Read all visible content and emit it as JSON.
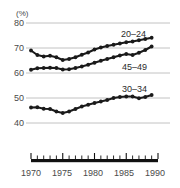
{
  "chart_data": {
    "type": "line",
    "title": "",
    "subtitle": "",
    "xlabel": "",
    "ylabel": "",
    "unit_label": "(%)",
    "xlim": [
      1969,
      1990
    ],
    "ylim": [
      36,
      82
    ],
    "yticks": [
      80,
      70,
      60,
      50,
      40
    ],
    "ytick_labels": [
      "80",
      "70",
      "60",
      "50",
      "40"
    ],
    "xticks": [
      1970,
      1975,
      1980,
      1985,
      1990
    ],
    "xtick_labels": [
      "1970",
      "1975",
      "1980",
      "1985",
      "1990"
    ],
    "minor_xtick_interval": 1,
    "grid": "horizontal",
    "legend_position": "inline-right",
    "marker": "filled-circle",
    "line_color": "#1a1a1a",
    "grid_color": "#b3b3b3",
    "axis_color": "#111111",
    "x": [
      1970,
      1971,
      1972,
      1973,
      1974,
      1975,
      1976,
      1977,
      1978,
      1979,
      1980,
      1981,
      1982,
      1983,
      1984,
      1985,
      1986,
      1987,
      1988,
      1989
    ],
    "series": [
      {
        "name": "20–24",
        "label": "20–24",
        "values": [
          69.0,
          67.2,
          66.6,
          66.9,
          66.3,
          65.2,
          65.6,
          66.3,
          67.3,
          68.2,
          69.4,
          70.2,
          70.8,
          71.3,
          71.8,
          72.3,
          72.6,
          73.1,
          73.6,
          74.1
        ]
      },
      {
        "name": "45–49",
        "label": "45–49",
        "values": [
          61.3,
          61.9,
          62.0,
          62.1,
          62.0,
          61.4,
          61.5,
          62.0,
          62.6,
          63.3,
          64.1,
          64.9,
          65.6,
          66.3,
          67.0,
          67.6,
          67.2,
          68.1,
          69.2,
          70.6
        ]
      },
      {
        "name": "30–34",
        "label": "30–34",
        "values": [
          46.2,
          46.3,
          45.7,
          45.6,
          44.6,
          44.0,
          44.6,
          45.6,
          46.6,
          47.3,
          48.0,
          48.6,
          49.2,
          50.0,
          50.4,
          50.6,
          50.6,
          49.9,
          50.4,
          51.2
        ]
      }
    ],
    "series_label_positions": [
      {
        "name": "20–24",
        "x": 121,
        "y": 29
      },
      {
        "name": "45–49",
        "x": 122,
        "y": 62
      },
      {
        "name": "30–34",
        "x": 122,
        "y": 84
      }
    ]
  }
}
